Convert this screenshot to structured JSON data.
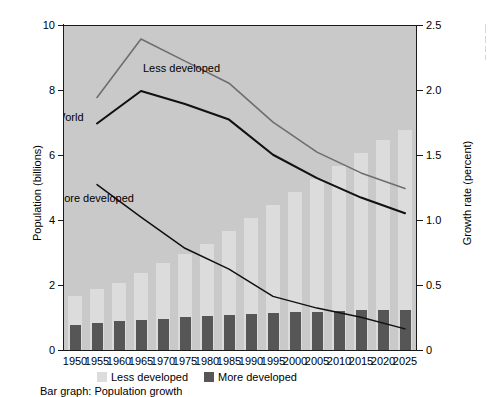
{
  "chart_data": {
    "type": "bar",
    "title": "",
    "caption": "Bar graph: Population growth",
    "xlabel": "",
    "categories": [
      "1950",
      "1955",
      "1960",
      "1965",
      "1970",
      "1975",
      "1980",
      "1985",
      "1990",
      "1995",
      "2000",
      "2005",
      "2010",
      "2015",
      "2020",
      "2025"
    ],
    "grid": false,
    "legend_position": "bottom",
    "axes": {
      "left": {
        "label": "Population (billions)",
        "ylim": [
          0,
          10
        ],
        "ticks": [
          0,
          2,
          4,
          6,
          8,
          10
        ],
        "tick_labels": [
          "0",
          "2",
          "4",
          "6",
          "8",
          "10"
        ]
      },
      "right": {
        "label": "Growth rate (percent)",
        "ylim": [
          0,
          2.5
        ],
        "ticks": [
          0,
          0.5,
          1.0,
          1.5,
          2.0,
          2.5
        ],
        "tick_labels": [
          "0",
          "0.5",
          "1.0",
          "1.5",
          "2.0",
          "2.5"
        ]
      }
    },
    "bar_series": [
      {
        "name": "Less developed",
        "color": "#dcdcdc",
        "axis": "left",
        "unit": "billions",
        "values": [
          1.7,
          1.9,
          2.1,
          2.4,
          2.7,
          3.0,
          3.3,
          3.7,
          4.1,
          4.5,
          4.9,
          5.3,
          5.7,
          6.1,
          6.5,
          6.8
        ]
      },
      {
        "name": "More developed",
        "color": "#565656",
        "axis": "left",
        "unit": "billions",
        "values": [
          0.81,
          0.86,
          0.91,
          0.96,
          1.0,
          1.05,
          1.08,
          1.11,
          1.15,
          1.17,
          1.19,
          1.21,
          1.24,
          1.26,
          1.27,
          1.27
        ]
      }
    ],
    "line_series": [
      {
        "name": "Less developed",
        "color": "#6e6e6e",
        "axis": "right",
        "unit": "percent",
        "x": [
          "1955",
          "1965",
          "1975",
          "1985",
          "1995",
          "2005",
          "2015",
          "2025"
        ],
        "values": [
          1.95,
          2.4,
          2.23,
          2.06,
          1.76,
          1.53,
          1.37,
          1.25
        ]
      },
      {
        "name": "World",
        "color": "#111111",
        "axis": "right",
        "unit": "percent",
        "x": [
          "1955",
          "1965",
          "1975",
          "1985",
          "1995",
          "2005",
          "2015",
          "2025"
        ],
        "values": [
          1.75,
          2.0,
          1.9,
          1.78,
          1.51,
          1.33,
          1.18,
          1.06
        ]
      },
      {
        "name": "More developed",
        "color": "#111111",
        "axis": "right",
        "unit": "percent",
        "x": [
          "1955",
          "1965",
          "1975",
          "1985",
          "1995",
          "2005",
          "2015",
          "2025"
        ],
        "values": [
          1.28,
          1.03,
          0.79,
          0.63,
          0.42,
          0.33,
          0.26,
          0.17
        ]
      }
    ],
    "series_labels": [
      {
        "text": "Less developed",
        "x": 1965,
        "y": 2.18
      },
      {
        "text": "World",
        "x": 1966,
        "y": 1.8
      },
      {
        "text": "More developed",
        "x": 1968,
        "y": 1.18
      }
    ]
  },
  "legend": {
    "items": [
      {
        "label": "Less developed",
        "swatch": "light"
      },
      {
        "label": "More developed",
        "swatch": "dark"
      }
    ]
  },
  "colors": {
    "plot_background": "#c9c9c9",
    "bar_light": "#dcdcdc",
    "bar_dark": "#565656",
    "line_world": "#111111",
    "line_less_developed": "#6e6e6e",
    "axis": "#1a1a1a"
  }
}
